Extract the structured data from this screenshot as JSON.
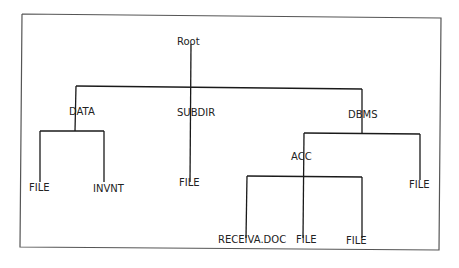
{
  "diagram": {
    "type": "directory-tree",
    "root": {
      "label": "Root",
      "children": [
        {
          "label": "DATA",
          "children": [
            {
              "label": "FILE"
            },
            {
              "label": "INVNT"
            }
          ]
        },
        {
          "label": "SUBDIR",
          "children": [
            {
              "label": "FILE"
            }
          ]
        },
        {
          "label": "DBMS",
          "children": [
            {
              "label": "ACC",
              "children": [
                {
                  "label": "RECEIVA.DOC"
                },
                {
                  "label": "FILE"
                },
                {
                  "label": "FILE"
                }
              ]
            },
            {
              "label": "FILE"
            }
          ]
        }
      ]
    },
    "line_color": "#1a1a1a",
    "frame_color": "#555555"
  },
  "labels": {
    "root": "Root",
    "data": "DATA",
    "subdir": "SUBDIR",
    "dbms": "DBMS",
    "data_file": "FILE",
    "data_invnt": "INVNT",
    "subdir_file": "FILE",
    "acc": "ACC",
    "dbms_file": "FILE",
    "acc_receiva": "RECEIVA.DOC",
    "acc_file1": "FILE",
    "acc_file2": "FILE"
  }
}
